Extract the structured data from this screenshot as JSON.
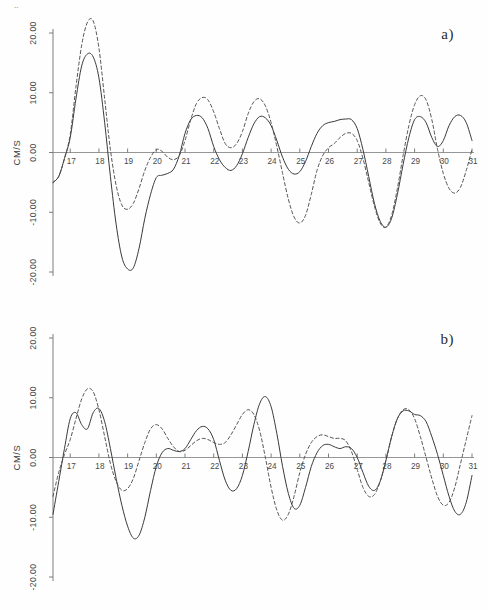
{
  "figure": {
    "corner_mark": "..",
    "width": 488,
    "height": 610,
    "background_color": "#ffffff",
    "line_color_solid": "#3a3a3a",
    "line_color_dashed": "#4a4a4a",
    "axis_color": "#6f6f6f"
  },
  "panels": [
    {
      "label": "a)"
    },
    {
      "label": "b)"
    }
  ],
  "chart_data": [
    {
      "type": "line",
      "panel": "a)",
      "title": "",
      "xlabel": "",
      "ylabel": "CM/S",
      "xlim": [
        16.4,
        31.0
      ],
      "ylim": [
        -20.0,
        20.0
      ],
      "grid": false,
      "legend": "none",
      "xticks": [
        17,
        18,
        19,
        20,
        21,
        22,
        23,
        24,
        25,
        26,
        27,
        28,
        29,
        30,
        31
      ],
      "xticklabels": [
        "17",
        "18",
        "19",
        "20",
        "21",
        "22",
        "23",
        "24",
        "25",
        "26",
        "27",
        "28",
        "29",
        "30",
        "31"
      ],
      "yticks": [
        -20.0,
        -10.0,
        0.0,
        10.0,
        20.0
      ],
      "yticklabels": [
        "-20.00",
        "-10.00",
        "0.00",
        "10.00",
        "20.00"
      ],
      "x": [
        16.4,
        16.6,
        16.8,
        17.0,
        17.2,
        17.4,
        17.6,
        17.8,
        18.0,
        18.2,
        18.4,
        18.6,
        18.8,
        19.0,
        19.2,
        19.4,
        19.6,
        19.8,
        20.0,
        20.2,
        20.4,
        20.6,
        20.8,
        21.0,
        21.2,
        21.4,
        21.6,
        21.8,
        22.0,
        22.2,
        22.4,
        22.6,
        22.8,
        23.0,
        23.2,
        23.4,
        23.6,
        23.8,
        24.0,
        24.2,
        24.4,
        24.6,
        24.8,
        25.0,
        25.2,
        25.4,
        25.6,
        25.8,
        26.0,
        26.2,
        26.4,
        26.6,
        26.8,
        27.0,
        27.2,
        27.4,
        27.6,
        27.8,
        28.0,
        28.2,
        28.4,
        28.6,
        28.8,
        29.0,
        29.2,
        29.4,
        29.6,
        29.8,
        30.0,
        30.2,
        30.4,
        30.6,
        30.8,
        31.0
      ],
      "series": [
        {
          "name": "solid",
          "style": "solid",
          "values": [
            -5.0,
            -4.0,
            -1.0,
            2.5,
            9.0,
            14.5,
            16.5,
            16.0,
            12.5,
            5.0,
            -4.0,
            -12.0,
            -17.5,
            -19.5,
            -19.3,
            -16.0,
            -11.0,
            -7.0,
            -4.2,
            -3.8,
            -3.5,
            -2.8,
            -0.5,
            3.2,
            5.5,
            6.2,
            5.8,
            4.0,
            1.0,
            -1.2,
            -2.5,
            -3.0,
            -2.2,
            -0.2,
            2.5,
            4.8,
            6.0,
            5.8,
            4.5,
            2.0,
            -0.8,
            -2.8,
            -3.6,
            -3.2,
            -1.5,
            1.0,
            3.2,
            4.5,
            5.0,
            5.2,
            5.5,
            5.6,
            5.5,
            4.0,
            0.5,
            -4.0,
            -8.5,
            -11.5,
            -12.5,
            -11.0,
            -7.0,
            -2.0,
            2.5,
            5.5,
            6.0,
            5.0,
            2.5,
            1.0,
            2.0,
            4.5,
            6.0,
            6.2,
            5.0,
            2.0
          ]
        },
        {
          "name": "dashed",
          "style": "dashed",
          "values": [
            -5.0,
            -4.0,
            -1.0,
            3.0,
            11.0,
            18.0,
            21.8,
            22.0,
            17.5,
            9.0,
            0.5,
            -5.5,
            -8.8,
            -9.5,
            -8.5,
            -6.0,
            -3.0,
            -0.8,
            0.5,
            0.2,
            -0.8,
            -1.2,
            -0.5,
            2.0,
            5.5,
            8.2,
            9.2,
            8.8,
            6.8,
            4.0,
            1.5,
            0.8,
            1.5,
            3.5,
            6.5,
            8.5,
            9.0,
            7.8,
            5.0,
            1.0,
            -3.5,
            -7.8,
            -10.8,
            -11.8,
            -10.5,
            -7.0,
            -3.0,
            -0.5,
            0.8,
            1.5,
            2.5,
            3.2,
            3.2,
            2.0,
            -1.0,
            -5.0,
            -9.0,
            -11.8,
            -12.5,
            -10.5,
            -6.0,
            -0.5,
            4.5,
            8.0,
            9.5,
            8.8,
            5.5,
            0.5,
            -3.5,
            -6.0,
            -6.8,
            -5.8,
            -3.0,
            0.5
          ]
        }
      ]
    },
    {
      "type": "line",
      "panel": "b)",
      "title": "",
      "xlabel": "",
      "ylabel": "CM/S",
      "xlim": [
        16.4,
        31.0
      ],
      "ylim": [
        -20.0,
        20.0
      ],
      "grid": false,
      "legend": "none",
      "xticks": [
        17,
        18,
        19,
        20,
        21,
        22,
        23,
        24,
        25,
        26,
        27,
        28,
        29,
        30,
        31
      ],
      "xticklabels": [
        "17",
        "18",
        "19",
        "20",
        "21",
        "22",
        "23",
        "24",
        "25",
        "26",
        "27",
        "28",
        "29",
        "30",
        "31"
      ],
      "yticks": [
        -20.0,
        -10.0,
        0.0,
        10.0,
        20.0
      ],
      "yticklabels": [
        "-20.00",
        "-10.00",
        "0.00",
        "10.00",
        "20.00"
      ],
      "x": [
        16.4,
        16.6,
        16.8,
        17.0,
        17.2,
        17.4,
        17.6,
        17.8,
        18.0,
        18.2,
        18.4,
        18.6,
        18.8,
        19.0,
        19.2,
        19.4,
        19.6,
        19.8,
        20.0,
        20.2,
        20.4,
        20.6,
        20.8,
        21.0,
        21.2,
        21.4,
        21.6,
        21.8,
        22.0,
        22.2,
        22.4,
        22.6,
        22.8,
        23.0,
        23.2,
        23.4,
        23.6,
        23.8,
        24.0,
        24.2,
        24.4,
        24.6,
        24.8,
        25.0,
        25.2,
        25.4,
        25.6,
        25.8,
        26.0,
        26.2,
        26.4,
        26.6,
        26.8,
        27.0,
        27.2,
        27.4,
        27.6,
        27.8,
        28.0,
        28.2,
        28.4,
        28.6,
        28.8,
        29.0,
        29.2,
        29.4,
        29.6,
        29.8,
        30.0,
        30.2,
        30.4,
        30.6,
        30.8,
        31.0
      ],
      "series": [
        {
          "name": "solid",
          "style": "solid",
          "values": [
            -9.5,
            -4.0,
            1.5,
            6.5,
            7.5,
            5.5,
            4.8,
            7.5,
            8.2,
            6.0,
            1.5,
            -3.5,
            -8.0,
            -11.5,
            -13.5,
            -13.0,
            -10.0,
            -5.5,
            -1.5,
            0.8,
            1.5,
            1.2,
            1.0,
            1.5,
            3.0,
            4.5,
            5.2,
            4.8,
            3.0,
            -0.5,
            -3.8,
            -5.5,
            -5.2,
            -3.0,
            1.0,
            5.5,
            9.0,
            10.2,
            8.5,
            4.0,
            -1.5,
            -6.0,
            -8.5,
            -8.0,
            -5.0,
            -1.5,
            0.8,
            2.0,
            2.2,
            1.8,
            1.5,
            1.8,
            1.5,
            0.0,
            -2.5,
            -4.8,
            -5.5,
            -4.0,
            -0.5,
            3.5,
            6.5,
            7.8,
            7.8,
            7.2,
            7.0,
            6.0,
            3.5,
            0.5,
            -3.0,
            -6.5,
            -9.0,
            -9.5,
            -7.5,
            -3.0
          ]
        },
        {
          "name": "dashed",
          "style": "dashed",
          "values": [
            -6.5,
            -2.5,
            0.5,
            3.0,
            6.5,
            9.8,
            11.5,
            11.0,
            8.0,
            3.5,
            -1.0,
            -4.0,
            -5.5,
            -5.2,
            -3.5,
            -0.5,
            2.5,
            4.8,
            5.5,
            4.8,
            3.2,
            1.8,
            1.0,
            1.2,
            2.0,
            2.8,
            3.2,
            3.0,
            2.5,
            2.2,
            2.5,
            3.8,
            5.5,
            7.2,
            8.0,
            7.2,
            4.5,
            0.0,
            -5.0,
            -8.8,
            -10.5,
            -9.5,
            -6.5,
            -2.5,
            0.5,
            2.5,
            3.5,
            3.8,
            3.5,
            3.2,
            3.2,
            2.8,
            1.0,
            -2.0,
            -5.0,
            -6.5,
            -6.2,
            -4.0,
            -0.5,
            3.5,
            6.5,
            8.0,
            8.0,
            6.5,
            3.5,
            0.0,
            -3.5,
            -6.5,
            -8.0,
            -7.5,
            -5.0,
            -1.0,
            3.0,
            7.0
          ]
        }
      ]
    }
  ]
}
